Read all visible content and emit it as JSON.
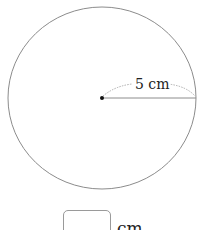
{
  "diagram": {
    "shape": "circle",
    "center": {
      "x": 102,
      "y": 98
    },
    "radius_px": {
      "rx": 94,
      "ry": 91
    },
    "stroke_color": "#8c8c8c",
    "radius_label": "5 cm",
    "radius_value": 5,
    "radius_unit": "cm"
  },
  "answer": {
    "value": "",
    "unit": "cm"
  }
}
